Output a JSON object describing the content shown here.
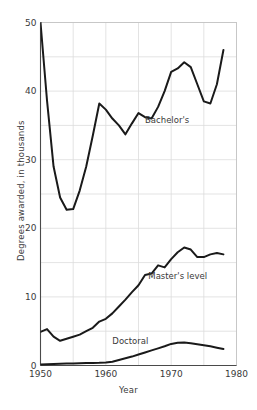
{
  "chart_data": {
    "type": "line",
    "title": "",
    "xlabel": "Year",
    "ylabel": "Degrees awarded, in thousands",
    "xlim": [
      1950,
      1980
    ],
    "ylim": [
      0,
      50
    ],
    "xticks": [
      1950,
      1960,
      1970,
      1980
    ],
    "xticklabels": [
      "1950",
      "1960",
      "1970",
      "1980"
    ],
    "yticks": [
      0,
      10,
      20,
      30,
      40,
      50
    ],
    "yticklabels": [
      "0",
      "10",
      "20",
      "30",
      "40",
      "50"
    ],
    "x_minor_step": 5,
    "y_minor_step": 5,
    "grid": true,
    "grid_color": "#dcdcdc",
    "line_color": "#1a1a1a",
    "line_width": 2.0,
    "legend": "inline-annotations",
    "series": [
      {
        "name": "Bachelor's",
        "label": "Bachelor's",
        "label_x": 1966.0,
        "label_y": 35.3,
        "x": [
          1950,
          1951,
          1952,
          1953,
          1954,
          1955,
          1956,
          1957,
          1958,
          1959,
          1960,
          1961,
          1962,
          1963,
          1964,
          1965,
          1966,
          1967,
          1968,
          1969,
          1970,
          1971,
          1972,
          1973,
          1974,
          1975,
          1976,
          1977,
          1978
        ],
        "values": [
          50.0,
          38.6,
          29.0,
          24.5,
          22.7,
          22.8,
          25.5,
          29.0,
          33.5,
          38.2,
          37.3,
          36.0,
          35.0,
          33.7,
          35.3,
          36.8,
          36.2,
          36.0,
          37.7,
          40.0,
          42.8,
          43.3,
          44.2,
          43.5,
          41.0,
          38.5,
          38.2,
          41.0,
          46.0
        ]
      },
      {
        "name": "Master's level",
        "label": "Master's level",
        "label_x": 1966.5,
        "label_y": 12.6,
        "x": [
          1950,
          1951,
          1952,
          1953,
          1954,
          1955,
          1956,
          1957,
          1958,
          1959,
          1960,
          1961,
          1962,
          1963,
          1964,
          1965,
          1966,
          1967,
          1968,
          1969,
          1970,
          1971,
          1972,
          1973,
          1974,
          1975,
          1976,
          1977,
          1978
        ],
        "values": [
          4.9,
          5.3,
          4.2,
          3.6,
          3.9,
          4.2,
          4.5,
          5.0,
          5.5,
          6.4,
          6.8,
          7.6,
          8.6,
          9.6,
          10.7,
          11.7,
          13.2,
          13.4,
          14.6,
          14.3,
          15.5,
          16.5,
          17.2,
          16.9,
          15.8,
          15.8,
          16.2,
          16.4,
          16.2
        ]
      },
      {
        "name": "Doctoral",
        "label": "Doctoral",
        "label_x": 1961.0,
        "label_y": 3.2,
        "x": [
          1950,
          1951,
          1952,
          1953,
          1954,
          1955,
          1956,
          1957,
          1958,
          1959,
          1960,
          1961,
          1962,
          1963,
          1964,
          1965,
          1966,
          1967,
          1968,
          1969,
          1970,
          1971,
          1972,
          1973,
          1974,
          1975,
          1976,
          1977,
          1978
        ],
        "values": [
          0.15,
          0.2,
          0.22,
          0.25,
          0.28,
          0.3,
          0.32,
          0.35,
          0.38,
          0.4,
          0.45,
          0.55,
          0.8,
          1.05,
          1.3,
          1.6,
          1.9,
          2.2,
          2.5,
          2.8,
          3.15,
          3.3,
          3.35,
          3.25,
          3.1,
          2.95,
          2.8,
          2.6,
          2.4
        ]
      }
    ]
  }
}
